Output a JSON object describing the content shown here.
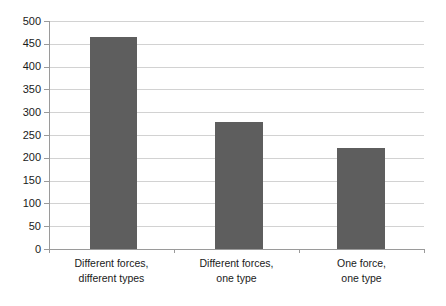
{
  "chart_data": {
    "type": "bar",
    "title": "",
    "subtitle": "",
    "xlabel": "",
    "ylabel": "",
    "categories": [
      "Different forces, different types",
      "Different forces, one type",
      "One force, one type"
    ],
    "category_lines": [
      [
        "Different forces,",
        "different types"
      ],
      [
        "Different forces,",
        "one type"
      ],
      [
        "One force,",
        "one type"
      ]
    ],
    "values": [
      465,
      278,
      222
    ],
    "ylim": [
      0,
      500
    ],
    "ytick_step": 50,
    "ytick_labels": [
      "0",
      "50",
      "100",
      "150",
      "200",
      "250",
      "300",
      "350",
      "400",
      "450",
      "500"
    ],
    "grid": true,
    "legend": false,
    "legend_position": "none",
    "colors": {
      "bar": "#5e5e5e",
      "gridline": "#d2d2d2",
      "axis": "#9a9a9a",
      "text": "#1a1a1a",
      "background": "#ffffff"
    }
  }
}
